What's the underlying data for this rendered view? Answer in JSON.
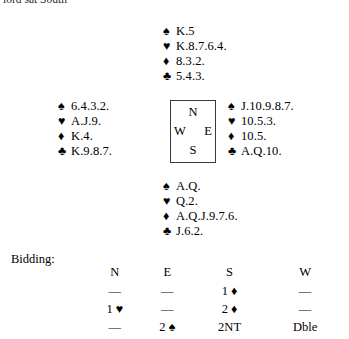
{
  "caption": "lord sat South",
  "compass": {
    "north": "N",
    "west": "W",
    "east": "E",
    "south": "S"
  },
  "suits": {
    "spade": "♠",
    "heart": "♥",
    "diamond": "♦",
    "club": "♣"
  },
  "hands": {
    "north": {
      "label": "North",
      "spades": "K.5",
      "hearts": "K.8.7.6.4.",
      "diamonds": "8.3.2.",
      "clubs": "5.4.3."
    },
    "west": {
      "label": "West",
      "spades": "6.4.3.2.",
      "hearts": "A.J.9.",
      "diamonds": "K.4.",
      "clubs": "K.9.8.7."
    },
    "east": {
      "label": "East",
      "spades": "J.10.9.8.7.",
      "hearts": "10.5.3.",
      "diamonds": "10.5.",
      "clubs": "A.Q.10."
    },
    "south": {
      "label": "South",
      "spades": "A.Q.",
      "hearts": "Q.2.",
      "diamonds": "A.Q.J.9.7.6.",
      "clubs": "J.6.2."
    }
  },
  "bidding": {
    "label": "Bidding:",
    "columns": [
      "N",
      "E",
      "S",
      "W"
    ],
    "rows": [
      [
        "—",
        "—",
        "1 ♦",
        "—"
      ],
      [
        "1 ♥",
        "—",
        "2 ♦",
        "—"
      ],
      [
        "—",
        "2 ♠",
        "2NT",
        "Dble"
      ]
    ]
  }
}
